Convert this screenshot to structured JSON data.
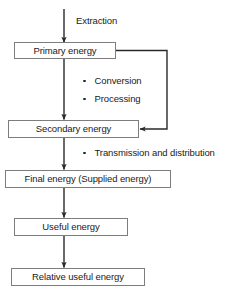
{
  "diagram": {
    "type": "flowchart",
    "colors": {
      "box_border": "#7d7d7d",
      "line": "#2a2a2a",
      "text": "#1a1a1a",
      "background": "#ffffff"
    },
    "nodes": [
      {
        "id": "primary",
        "label": "Primary energy"
      },
      {
        "id": "secondary",
        "label": "Secondary energy"
      },
      {
        "id": "final",
        "label": "Final energy (Supplied energy)"
      },
      {
        "id": "useful",
        "label": "Useful energy"
      },
      {
        "id": "relative",
        "label": "Relative useful energy"
      }
    ],
    "edge_labels": [
      {
        "id": "extraction",
        "label": "Extraction"
      }
    ],
    "bullets": [
      {
        "id": "conversion",
        "label": "Conversion"
      },
      {
        "id": "processing",
        "label": "Processing"
      },
      {
        "id": "transmission",
        "label": "Transmission and distribution"
      }
    ]
  }
}
